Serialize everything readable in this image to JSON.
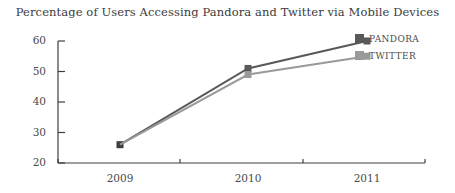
{
  "chart_data": {
    "type": "line",
    "title": "Percentage of Users Accessing Pandora and Twitter via Mobile Devices",
    "xlabel": "",
    "ylabel": "",
    "categories": [
      "2009",
      "2010",
      "2011"
    ],
    "ylim": [
      20,
      60
    ],
    "yticks": [
      20,
      30,
      40,
      50,
      60
    ],
    "ytick_labels": [
      "20",
      "30",
      "40",
      "50",
      "60"
    ],
    "grid": false,
    "legend_position": "right",
    "marker": "square",
    "series": [
      {
        "name": "PANDORA",
        "color": "#595959",
        "values": [
          26,
          51,
          60
        ]
      },
      {
        "name": "TWITTER",
        "color": "#9a9a9a",
        "values": [
          26,
          49,
          55
        ]
      }
    ]
  },
  "axis": {
    "color": "#3f3f3f"
  }
}
